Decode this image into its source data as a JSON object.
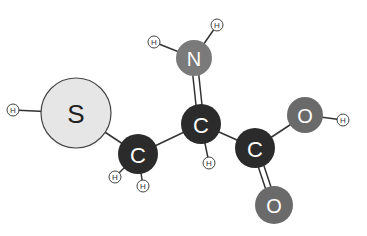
{
  "colors": {
    "sulfur": "#e6e6e6",
    "carbon": "#2b2b2b",
    "nitrogen": "#7a7a7a",
    "oxygen": "#6a6a6a",
    "hydrogen": "#ffffff",
    "bond": "#333333"
  },
  "atoms": [
    {
      "id": "S",
      "label": "S",
      "element": "sulfur"
    },
    {
      "id": "C1",
      "label": "C",
      "element": "carbon"
    },
    {
      "id": "C2",
      "label": "C",
      "element": "carbon"
    },
    {
      "id": "C3",
      "label": "C",
      "element": "carbon"
    },
    {
      "id": "N",
      "label": "N",
      "element": "nitrogen"
    },
    {
      "id": "O1",
      "label": "O",
      "element": "oxygen"
    },
    {
      "id": "O2",
      "label": "O",
      "element": "oxygen"
    },
    {
      "id": "H1",
      "label": "H",
      "element": "hydrogen"
    },
    {
      "id": "H2",
      "label": "H",
      "element": "hydrogen"
    },
    {
      "id": "H3",
      "label": "H",
      "element": "hydrogen"
    },
    {
      "id": "H4",
      "label": "H",
      "element": "hydrogen"
    },
    {
      "id": "H5",
      "label": "H",
      "element": "hydrogen"
    },
    {
      "id": "H6",
      "label": "H",
      "element": "hydrogen"
    },
    {
      "id": "H7",
      "label": "H",
      "element": "hydrogen"
    }
  ]
}
